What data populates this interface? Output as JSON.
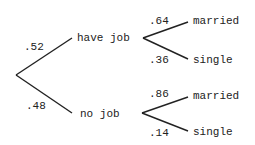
{
  "diagram": {
    "type": "probability-tree",
    "colors": {
      "line": "#222222",
      "text": "#222222",
      "background": "#ffffff"
    },
    "level1": [
      {
        "id": "have_job",
        "label": "have job",
        "prob": ".52"
      },
      {
        "id": "no_job",
        "label": "no job",
        "prob": ".48"
      }
    ],
    "level2": {
      "have_job": [
        {
          "label": "married",
          "prob": ".64"
        },
        {
          "label": "single",
          "prob": ".36"
        }
      ],
      "no_job": [
        {
          "label": "married",
          "prob": ".86"
        },
        {
          "label": "single",
          "prob": ".14"
        }
      ]
    }
  }
}
